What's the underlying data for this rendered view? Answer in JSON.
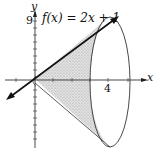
{
  "figure": {
    "type": "solid-of-revolution",
    "function_label": "f(x) = 2x + 1",
    "axis_labels": {
      "x": "x",
      "y": "y"
    },
    "tick_labels": {
      "x_tick": "4",
      "y_tick": "9"
    },
    "colors": {
      "line": "#111111",
      "shading": "#d4d4d4",
      "axis": "#333333",
      "background": "#ffffff"
    }
  }
}
